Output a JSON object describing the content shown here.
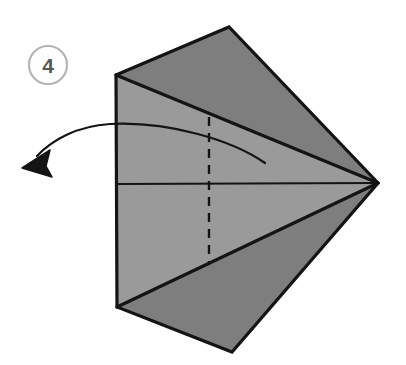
{
  "figure": {
    "background_color": "#ffffff",
    "step_badge": {
      "label": "4",
      "circle_stroke_color": "#b4b4b4",
      "text_color": "#58585a",
      "center_x": 48,
      "center_y": 65,
      "radius": 19
    },
    "colors": {
      "paper_front_light": "#9a9a9a",
      "paper_back_dark": "#7e7e7e",
      "outline": "#141414",
      "fold_line": "#141414",
      "dashed_crease": "#141414",
      "arrow": "#141414"
    }
  },
  "shapes": {
    "outline": {
      "name": "folded-paper-outline",
      "points": "116,75 229,27 378,183 232,352 117,307"
    },
    "upper_flap": {
      "name": "upper-dark-flap",
      "points": "116,75 229,27 378,183",
      "fill": "#7e7e7e"
    },
    "lower_flap": {
      "name": "lower-dark-flap",
      "points": "117,307 232,352 378,183",
      "fill": "#7e7e7e"
    },
    "inner_kite": {
      "name": "inner-light-panel",
      "points": "116,75 378,183 117,307",
      "fill": "#9a9a9a"
    }
  },
  "lines": {
    "horizontal_center": {
      "name": "horizontal-center-fold",
      "x1": 117,
      "y1": 184,
      "x2": 378,
      "y2": 183
    },
    "vertical_dashed": {
      "name": "vertical-dashed-crease",
      "x": 209,
      "y1": 117,
      "y2": 265,
      "dash_pattern": "9 7"
    },
    "upper_diagonal": {
      "name": "upper-fold-edge",
      "x1": 116,
      "y1": 75,
      "x2": 378,
      "y2": 183
    },
    "lower_diagonal": {
      "name": "lower-fold-edge",
      "x1": 117,
      "y1": 307,
      "x2": 378,
      "y2": 183
    }
  },
  "arrow": {
    "name": "fold-direction-arrow",
    "path": "M 265,163 C 232,140 168,121 110,124 C 77,126 52,140 37,156",
    "head_points": "22,168 50,150 46,166 52,177",
    "tip_x": 22,
    "tip_y": 168,
    "stroke_width": 2.2,
    "direction": "left"
  }
}
